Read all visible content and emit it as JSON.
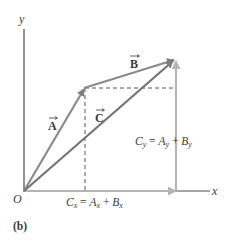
{
  "figure": {
    "panel_label": "(b)",
    "axes": {
      "x_label": "x",
      "y_label": "y",
      "origin_label": "O"
    },
    "vectors": [
      {
        "name": "A",
        "label": "A",
        "from": [
          24,
          191
        ],
        "to": [
          84,
          88
        ],
        "color": "#8a8a8a"
      },
      {
        "name": "B",
        "label": "B",
        "from": [
          84,
          88
        ],
        "to": [
          175,
          60
        ],
        "color": "#8a8a8a"
      },
      {
        "name": "C",
        "label": "C",
        "from": [
          24,
          191
        ],
        "to": [
          175,
          60
        ],
        "color": "#6f6f6f"
      }
    ],
    "components": {
      "cx_equation": {
        "lhs": "C",
        "lhs_sub": "x",
        "eq": " = ",
        "a": "A",
        "a_sub": "x",
        "plus": " + ",
        "b": "B",
        "b_sub": "x"
      },
      "cy_equation": {
        "lhs": "C",
        "lhs_sub": "y",
        "eq": " = ",
        "a": "A",
        "a_sub": "y",
        "plus": " + ",
        "b": "B",
        "b_sub": "y"
      }
    },
    "colors": {
      "axis": "#4a4a4a",
      "vector": "#8a8a8a",
      "component": "#b5b5b5",
      "dashed": "#555555",
      "text": "#3a3a3a"
    }
  }
}
